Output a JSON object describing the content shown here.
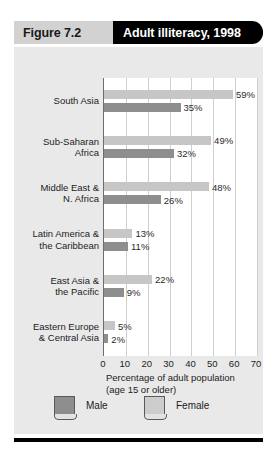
{
  "header": {
    "figure_number": "Figure 7.2",
    "title": "Adult illiteracy, 1998"
  },
  "legend": {
    "male_label": "Male",
    "female_label": "Female"
  },
  "axis": {
    "caption": "Percentage of adult population\n(age 15 or older)"
  },
  "colors": {
    "female_bar": "#c6c6c6",
    "male_bar": "#8e8e8e",
    "header_band": "#000000",
    "figure_number_band": "#d2d2d2",
    "panel": "#e9e9e9",
    "gridline": "#cfcfcf"
  },
  "chart_data": {
    "type": "bar",
    "orientation": "horizontal",
    "title": "Adult illiteracy, 1998",
    "xlabel": "Percentage of adult population (age 15 or older)",
    "ylabel": "",
    "xlim": [
      0,
      70
    ],
    "xticks": [
      0,
      10,
      20,
      30,
      40,
      50,
      60,
      70
    ],
    "xtick_labels": [
      "0",
      "10",
      "20",
      "30",
      "40",
      "50",
      "60",
      "70"
    ],
    "grid": true,
    "legend_position": "bottom",
    "categories": [
      "South Asia",
      "Sub-Saharan Africa",
      "Middle East & N. Africa",
      "Latin America & the Caribbean",
      "East Asia & the Pacific",
      "Eastern Europe & Central Asia"
    ],
    "category_display": [
      "South Asia",
      "Sub-Saharan\nAfrica",
      "Middle East &\nN. Africa",
      "Latin America &\nthe Caribbean",
      "East Asia &\nthe Pacific",
      "Eastern Europe\n& Central Asia"
    ],
    "series": [
      {
        "name": "Female",
        "color": "#c6c6c6",
        "values": [
          59,
          49,
          48,
          13,
          22,
          5
        ],
        "labels": [
          "59%",
          "49%",
          "48%",
          "13%",
          "22%",
          "5%"
        ]
      },
      {
        "name": "Male",
        "color": "#8e8e8e",
        "values": [
          35,
          32,
          26,
          11,
          9,
          2
        ],
        "labels": [
          "35%",
          "32%",
          "26%",
          "11%",
          "9%",
          "2%"
        ]
      }
    ]
  }
}
